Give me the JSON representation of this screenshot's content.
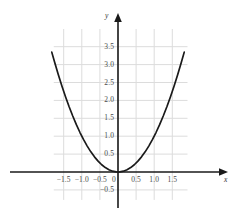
{
  "chart_data": {
    "type": "line",
    "title": "",
    "subtitle": "",
    "xlabel": "x",
    "ylabel": "y",
    "function": "y = x^2",
    "grid": true,
    "legend": null,
    "legend_position": "none",
    "xlim": [
      -1.83,
      1.92
    ],
    "ylim": [
      -0.78,
      4.05
    ],
    "x_ticks": [
      -1.5,
      -1.0,
      -0.5,
      0.5,
      1.0,
      1.5
    ],
    "x_tick_labels": [
      "−1.5",
      "−1.0",
      "−0.5",
      "0.5",
      "1.0",
      "1.5"
    ],
    "y_ticks": [
      -0.5,
      0.5,
      1.0,
      1.5,
      2.0,
      2.5,
      3.0,
      3.5
    ],
    "y_tick_labels": [
      "−0.5",
      "0.5",
      "1.0",
      "1.5",
      "2.0",
      "2.5",
      "3.0",
      "3.5"
    ],
    "origin_label": "0",
    "x_gridlines": [
      -1.5,
      -1.0,
      -0.5,
      0.0,
      0.5,
      1.0,
      1.5
    ],
    "y_gridlines": [
      -0.5,
      0.5,
      1.0,
      1.5,
      2.0,
      2.5,
      3.0,
      3.5
    ],
    "series": [
      {
        "name": "y = x^2",
        "color": "#1a1a1a",
        "x": [
          -1.83,
          -1.75,
          -1.65,
          -1.55,
          -1.45,
          -1.35,
          -1.25,
          -1.15,
          -1.05,
          -0.95,
          -0.85,
          -0.75,
          -0.65,
          -0.55,
          -0.45,
          -0.35,
          -0.25,
          -0.15,
          -0.05,
          0.0,
          0.05,
          0.15,
          0.25,
          0.35,
          0.45,
          0.55,
          0.65,
          0.75,
          0.85,
          0.95,
          1.05,
          1.15,
          1.25,
          1.35,
          1.45,
          1.55,
          1.65,
          1.75,
          1.83
        ],
        "y": [
          3.349,
          3.063,
          2.723,
          2.403,
          2.103,
          1.823,
          1.563,
          1.323,
          1.103,
          0.903,
          0.723,
          0.563,
          0.423,
          0.303,
          0.203,
          0.123,
          0.063,
          0.023,
          0.003,
          0.0,
          0.003,
          0.023,
          0.063,
          0.123,
          0.203,
          0.303,
          0.423,
          0.563,
          0.723,
          0.903,
          1.103,
          1.323,
          1.563,
          1.823,
          2.103,
          2.403,
          2.723,
          3.063,
          3.349
        ]
      }
    ],
    "colors": {
      "curve": "#1a1a1a",
      "axis": "#1a1a1a",
      "grid": "#dcdcdc",
      "tick_text": "#4a4a4a",
      "background": "#ffffff"
    }
  }
}
